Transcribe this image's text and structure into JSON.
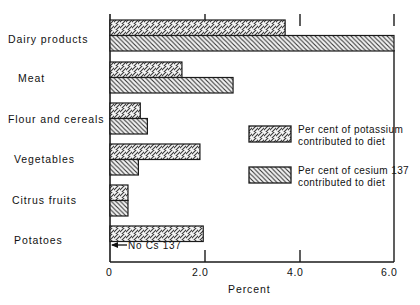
{
  "chart_data": {
    "type": "bar",
    "orientation": "horizontal",
    "title": "",
    "xlabel": "Percent",
    "ylabel": "",
    "xlim": [
      0,
      6.0
    ],
    "xticks": [
      "0",
      "2.0",
      "4.0",
      "6.0"
    ],
    "xtick_values": [
      0,
      2.0,
      4.0,
      6.0
    ],
    "grid": false,
    "legend_position": "right-middle",
    "categories": [
      "Dairy products",
      "Meat",
      "Flour and cereals",
      "Vegetables",
      "Citrus fruits",
      "Potatoes"
    ],
    "series": [
      {
        "name": "Per cent of potassium contributed to diet",
        "hatch": "forward-slash",
        "values": [
          3.7,
          1.52,
          0.64,
          1.9,
          0.38,
          1.97
        ]
      },
      {
        "name": "Per cent of cesium 137 contributed to diet",
        "hatch": "back-slash",
        "values": [
          6.0,
          2.6,
          0.79,
          0.6,
          0.38,
          0.0
        ]
      }
    ],
    "annotations": [
      {
        "text": "No  Cs 137",
        "arrow": "left",
        "target_category": "Potatoes",
        "target_series": "Per cent of cesium 137 contributed to diet"
      }
    ]
  },
  "legend": {
    "entries": [
      {
        "line1": "Per cent of  potassium",
        "line2": "contributed  to diet",
        "swatch": "hatch-forward-slash-swatch"
      },
      {
        "line1": "Per cent of cesium 137",
        "line2": "contributed  to diet",
        "swatch": "hatch-back-slash-swatch"
      }
    ]
  },
  "colors": {
    "ink": "#111111",
    "axis": "#1a1a1a",
    "bar_fill": "#f2f2f2",
    "hatch": "#333333"
  }
}
